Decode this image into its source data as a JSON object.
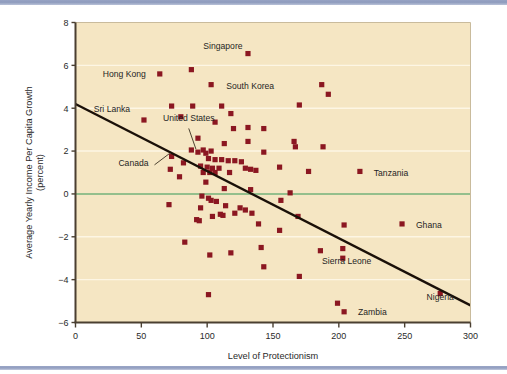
{
  "figure": {
    "background_color": "#ffffff",
    "plot_background_color": "#f5e6c3",
    "rule_color": "#8e9bbd",
    "marker_color": "#8b1721",
    "trendline_color": "#1a1008",
    "zeroline_color": "#2e8b3d",
    "gridline_color": "#fdf6e4",
    "axis_color": "#4a3f31"
  },
  "chart_data": {
    "type": "scatter",
    "title": "",
    "xlabel": "Level of Protectionism",
    "ylabel": "Average Yearly Income Per Capita Growth",
    "ylabel_sub": "(percent)",
    "xlim": [
      0,
      300
    ],
    "ylim": [
      -6,
      8
    ],
    "xticks": [
      0,
      50,
      100,
      150,
      200,
      250,
      300
    ],
    "yticks": [
      8,
      6,
      4,
      2,
      0,
      -2,
      -4,
      -6
    ],
    "xtick_labels": [
      "0",
      "50",
      "100",
      "150",
      "200",
      "250",
      "300"
    ],
    "ytick_labels": [
      "8",
      "6",
      "4",
      "2",
      "0",
      "−2",
      "−4",
      "−6"
    ],
    "grid": true,
    "grid_axis": "y",
    "legend": false,
    "zero_reference_line": 0,
    "trendline": {
      "type": "linear",
      "x0": 0,
      "y0": 4.2,
      "x1": 300,
      "y1": -5.2,
      "slope": -0.03133,
      "intercept": 4.2
    },
    "annotations": [
      {
        "label": "Singapore",
        "x": 88,
        "y": 5.8,
        "label_x": 112,
        "label_y": 6.55,
        "anchor": "middle",
        "leader": false
      },
      {
        "label": "Hong Kong",
        "x": 64,
        "y": 5.6,
        "label_x": 58,
        "label_y": 5.62,
        "anchor": "end",
        "leader": false
      },
      {
        "label": "South Korea",
        "x": 103,
        "y": 5.1,
        "label_x": 110,
        "label_y": 5.05,
        "anchor": "start",
        "leader": false
      },
      {
        "label": "Sri Lanka",
        "x": 52,
        "y": 3.45,
        "label_x": 46,
        "label_y": 3.95,
        "anchor": "end",
        "leader": false
      },
      {
        "label": "United States",
        "x": 93,
        "y": 1.95,
        "label_x": 86,
        "label_y": 3.15,
        "anchor": "middle",
        "leader": true
      },
      {
        "label": "Canada",
        "x": 73,
        "y": 1.75,
        "label_x": 60,
        "label_y": 1.45,
        "anchor": "end",
        "leader": true
      },
      {
        "label": "Tanzania",
        "x": 216,
        "y": 1.05,
        "label_x": 222,
        "label_y": 1.0,
        "anchor": "start",
        "leader": false
      },
      {
        "label": "Ghana",
        "x": 248,
        "y": -1.4,
        "label_x": 254,
        "label_y": -1.45,
        "anchor": "start",
        "leader": false
      },
      {
        "label": "Sierra Leone",
        "x": 203,
        "y": -3.0,
        "label_x": 206,
        "label_y": -3.5,
        "anchor": "middle",
        "leader": false
      },
      {
        "label": "Zambia",
        "x": 204,
        "y": -5.5,
        "label_x": 210,
        "label_y": -5.5,
        "anchor": "start",
        "leader": false
      },
      {
        "label": "Nigeria",
        "x": 277,
        "y": -4.65,
        "label_x": 277,
        "label_y": -5.2,
        "anchor": "middle",
        "leader": false
      }
    ],
    "points": [
      [
        64,
        5.6
      ],
      [
        88,
        5.8
      ],
      [
        131,
        6.55
      ],
      [
        103,
        5.1
      ],
      [
        187,
        5.1
      ],
      [
        192,
        4.65
      ],
      [
        73,
        4.1
      ],
      [
        89,
        4.1
      ],
      [
        111,
        4.1
      ],
      [
        170,
        4.15
      ],
      [
        118,
        3.75
      ],
      [
        52,
        3.45
      ],
      [
        80,
        3.6
      ],
      [
        106,
        3.35
      ],
      [
        120,
        3.05
      ],
      [
        131,
        3.1
      ],
      [
        143,
        3.05
      ],
      [
        93,
        2.6
      ],
      [
        131,
        2.45
      ],
      [
        113,
        2.35
      ],
      [
        166,
        2.45
      ],
      [
        167,
        2.2
      ],
      [
        188,
        2.2
      ],
      [
        93,
        1.95
      ],
      [
        97,
        2.05
      ],
      [
        88,
        2.05
      ],
      [
        99,
        1.9
      ],
      [
        103,
        2.0
      ],
      [
        143,
        1.95
      ],
      [
        73,
        1.75
      ],
      [
        101,
        1.65
      ],
      [
        106,
        1.6
      ],
      [
        111,
        1.6
      ],
      [
        116,
        1.55
      ],
      [
        121,
        1.55
      ],
      [
        126,
        1.5
      ],
      [
        82,
        1.45
      ],
      [
        95,
        1.3
      ],
      [
        100,
        1.25
      ],
      [
        104,
        1.2
      ],
      [
        109,
        1.2
      ],
      [
        129,
        1.2
      ],
      [
        133,
        1.15
      ],
      [
        137,
        1.1
      ],
      [
        155,
        1.25
      ],
      [
        177,
        1.05
      ],
      [
        216,
        1.05
      ],
      [
        72,
        1.15
      ],
      [
        79,
        0.8
      ],
      [
        97,
        1.0
      ],
      [
        102,
        1.0
      ],
      [
        106,
        1.0
      ],
      [
        117,
        1.0
      ],
      [
        99,
        0.55
      ],
      [
        113,
        0.25
      ],
      [
        133,
        0.2
      ],
      [
        96,
        -0.1
      ],
      [
        101,
        -0.2
      ],
      [
        103,
        -0.3
      ],
      [
        107,
        -0.35
      ],
      [
        163,
        0.05
      ],
      [
        156,
        -0.3
      ],
      [
        71,
        -0.5
      ],
      [
        95,
        -0.65
      ],
      [
        114,
        -0.55
      ],
      [
        125,
        -0.65
      ],
      [
        129,
        -0.75
      ],
      [
        92,
        -1.2
      ],
      [
        94,
        -1.25
      ],
      [
        104,
        -1.05
      ],
      [
        110,
        -0.95
      ],
      [
        112,
        -1.0
      ],
      [
        121,
        -0.9
      ],
      [
        134,
        -0.9
      ],
      [
        139,
        -1.4
      ],
      [
        169,
        -1.05
      ],
      [
        204,
        -1.45
      ],
      [
        248,
        -1.4
      ],
      [
        155,
        -1.7
      ],
      [
        83,
        -2.25
      ],
      [
        141,
        -2.5
      ],
      [
        186,
        -2.65
      ],
      [
        203,
        -2.55
      ],
      [
        102,
        -2.85
      ],
      [
        118,
        -2.75
      ],
      [
        203,
        -3.0
      ],
      [
        143,
        -3.4
      ],
      [
        170,
        -3.85
      ],
      [
        101,
        -4.7
      ],
      [
        277,
        -4.65
      ],
      [
        199,
        -5.1
      ],
      [
        204,
        -5.5
      ]
    ]
  }
}
